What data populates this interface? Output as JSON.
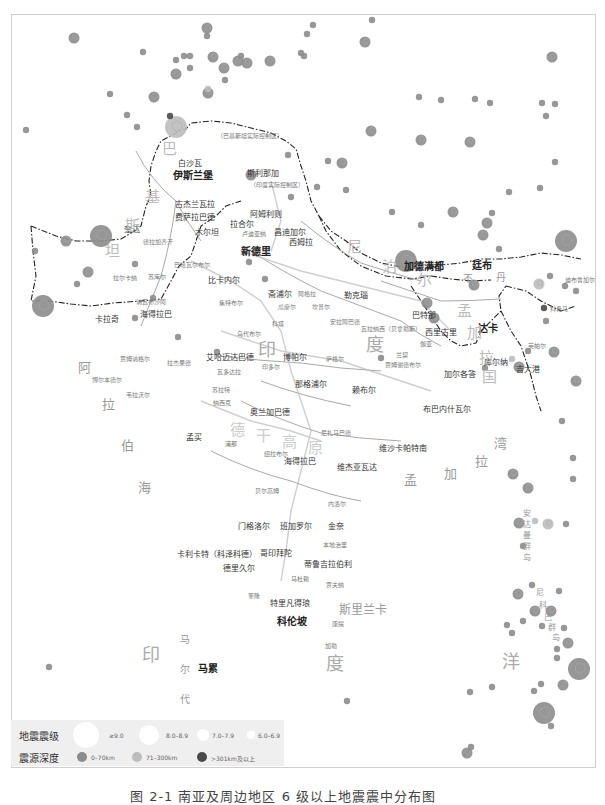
{
  "colors": {
    "shallow": "#8c8c8c",
    "intermediate": "#bdbdbd",
    "deep": "#4a4a4a",
    "border": "#222222",
    "river": "#9a9a9a",
    "legend_bg": "#efefef"
  },
  "legend": {
    "magnitude_title": "地震震级",
    "magnitude_items": [
      {
        "label": "≥9.0",
        "size": 30
      },
      {
        "label": "8.0–8.9",
        "size": 22
      },
      {
        "label": "7.0–7.9",
        "size": 14
      },
      {
        "label": "6.0–6.9",
        "size": 8
      }
    ],
    "depth_title": "震源深度",
    "depth_items": [
      {
        "label": "0–70km",
        "color": "#8c8c8c"
      },
      {
        "label": "71–300km",
        "color": "#bdbdbd"
      },
      {
        "label": ">301km及以上",
        "color": "#4a4a4a"
      }
    ]
  },
  "caption": "图 2-1  南亚及周边地区 6 级以上地震震中分布图",
  "labels": {
    "capitals": {
      "islamabad": "伊斯兰堡",
      "new_delhi": "新德里",
      "kathmandu": "加德满都",
      "thimphu": "廷布",
      "dhaka": "达卡",
      "colombo": "科伦坡",
      "male": "马累"
    },
    "cities": {
      "peshawar": "白沙瓦",
      "srinagar": "斯利那加",
      "srinagar_note": "（印度实际控制区）",
      "pak_kashmir_note": "（巴基斯坦实际控制区）",
      "gilgit": "吉尔吉特",
      "kargil": "卡尔吉尔",
      "leh": "列城",
      "gujranwala": "古杰兰瓦拉",
      "faisalabad": "费萨拉巴德",
      "amritsar": "阿姆利则",
      "lahore": "拉合尔",
      "multan": "木尔坦",
      "ludhiana": "卢迪亚纳",
      "chandigarh": "昌迪加尔",
      "shimla": "西姆拉",
      "quetta": "奎达",
      "dera_ghazi_khan": "德拉加齐汗",
      "bahawalpur": "巴哈瓦尔布尔",
      "sukkur": "苏库尔",
      "larkana": "拉尔卡纳",
      "nawabshah": "讷瓦布沙阿",
      "hyderabad_pk": "海得拉巴",
      "karachi": "卡拉奇",
      "bikaner": "比卡内尔",
      "jaipur": "斋浦尔",
      "jodhpur": "焦特布尔",
      "agra": "阿格拉",
      "gwalior": "瓜廖尔",
      "kanpur": "坎普尔",
      "lucknow": "勒克瑙",
      "allahabad": "安拉阿巴德",
      "varanasi": "瓦拉纳西（贝拿勒斯）",
      "kota": "科塔",
      "udaipur": "乌代布尔",
      "patna": "巴特那",
      "siliguri": "西里古里",
      "gaya": "伽亚",
      "jamshedpur": "贾姆谢德布尔",
      "ranchi": "兰契",
      "dhanbad": "丹巴德",
      "kolkata": "加尔各答",
      "khulna": "库尔纳",
      "chittagong": "吉大港",
      "imphal": "英帕尔",
      "kohima": "科希马",
      "dibrugarh": "迪布鲁加尔",
      "ahmedabad": "艾哈迈达巴德",
      "rajkot": "拉杰果德",
      "jamnagar": "贾姆讷格尔",
      "porbandar": "博尔本德尔",
      "veraval": "韦拉沃尔",
      "vadodara": "瓦多达拉",
      "surat": "苏拉特",
      "bhopal": "博帕尔",
      "indore": "印多尔",
      "sagar": "萨格尔",
      "jabalpur": "贾巴尔普尔",
      "nagpur": "那格浦尔",
      "raipur": "赖布尔",
      "bhubaneswar": "布巴内什瓦尔",
      "nashik": "纳西克",
      "mumbai": "孟买",
      "aurangabad": "奥兰加巴德",
      "pune": "浦那",
      "solapur": "绍拉布尔",
      "nizamabad": "尼扎马巴德",
      "hyderabad_in": "海得拉巴",
      "vijayawada": "维杰亚瓦达",
      "visakhapatnam": "维沙卡帕特南",
      "belgaum": "贝尔高姆",
      "nellore": "内洛尔",
      "mangalore": "门格洛尔",
      "bangalore": "班加罗尔",
      "chennai": "金奈",
      "calicut": "卡利卡特（科泽科德）",
      "coimbatore": "哥印拜陀",
      "pondicherry": "本地治里",
      "trichur": "德里久尔",
      "tiruchirappalli": "蒂鲁吉拉伯利",
      "madurai": "马杜赖",
      "kochi": "奎隆",
      "jaffna": "贾夫纳",
      "thiruvananthapuram": "特里凡得琅",
      "kandy": "康提",
      "galle": "加勒"
    },
    "regions": {
      "india_1": "印",
      "india_2": "度",
      "pakistan_1": "巴",
      "pakistan_2": "基",
      "pakistan_3": "斯",
      "pakistan_4": "坦",
      "nepal_1": "尼",
      "nepal_2": "泊",
      "nepal_3": "尔",
      "bhutan_1": "不",
      "bhutan_2": "丹",
      "bangladesh_1": "孟",
      "bangladesh_2": "加",
      "bangladesh_3": "拉",
      "bangladesh_4": "国",
      "sri_lanka": "斯里兰卡",
      "arabian_sea": [
        "阿",
        "拉",
        "伯",
        "海"
      ],
      "bay_of_bengal": [
        "孟",
        "加",
        "拉",
        "湾"
      ],
      "indian_ocean": [
        "印",
        "度",
        "洋"
      ],
      "maldives": [
        "马",
        "尔",
        "代",
        "夫"
      ],
      "andaman": [
        "安",
        "达",
        "曼",
        "群",
        "岛"
      ],
      "nicobar": [
        "尼",
        "科",
        "巴",
        "群",
        "岛"
      ],
      "deccan": [
        "德",
        "干",
        "高",
        "原"
      ]
    }
  },
  "chart_data": {
    "type": "scatter",
    "title": "南亚及周边地区 6 级以上地震震中分布图",
    "legend": {
      "size_encoding": [
        "≥9.0",
        "8.0–8.9",
        "7.0–7.9",
        "6.0–6.9"
      ],
      "color_encoding": [
        "0–70km",
        "71–300km",
        ">301km及以上"
      ]
    },
    "points": [
      {
        "x": 73,
        "y": 37,
        "m": 7,
        "d": 0
      },
      {
        "x": 142,
        "y": 51,
        "m": 6,
        "d": 0
      },
      {
        "x": 175,
        "y": 59,
        "m": 6,
        "d": 0
      },
      {
        "x": 183,
        "y": 55,
        "m": 6,
        "d": 0
      },
      {
        "x": 189,
        "y": 55,
        "m": 6,
        "d": 0
      },
      {
        "x": 206,
        "y": 27,
        "m": 7,
        "d": 0
      },
      {
        "x": 206,
        "y": 35,
        "m": 6,
        "d": 0
      },
      {
        "x": 212,
        "y": 56,
        "m": 7,
        "d": 0
      },
      {
        "x": 237,
        "y": 60,
        "m": 7,
        "d": 0
      },
      {
        "x": 240,
        "y": 55,
        "m": 6,
        "d": 0
      },
      {
        "x": 246,
        "y": 62,
        "m": 7,
        "d": 0
      },
      {
        "x": 269,
        "y": 60,
        "m": 7,
        "d": 0
      },
      {
        "x": 223,
        "y": 67,
        "m": 7,
        "d": 0
      },
      {
        "x": 175,
        "y": 73,
        "m": 7,
        "d": 0
      },
      {
        "x": 189,
        "y": 67,
        "m": 6,
        "d": 0
      },
      {
        "x": 224,
        "y": 79,
        "m": 6,
        "d": 0
      },
      {
        "x": 207,
        "y": 92,
        "m": 7,
        "d": 0
      },
      {
        "x": 207,
        "y": 88,
        "m": 6,
        "d": 1
      },
      {
        "x": 153,
        "y": 96,
        "m": 7,
        "d": 0
      },
      {
        "x": 109,
        "y": 93,
        "m": 6,
        "d": 0
      },
      {
        "x": 126,
        "y": 114,
        "m": 6,
        "d": 0
      },
      {
        "x": 136,
        "y": 126,
        "m": 6,
        "d": 0
      },
      {
        "x": 175,
        "y": 126,
        "m": 8,
        "d": 1
      },
      {
        "x": 169,
        "y": 115,
        "m": 6,
        "d": 2
      },
      {
        "x": 25,
        "y": 129,
        "m": 6,
        "d": 0
      },
      {
        "x": 300,
        "y": 52,
        "m": 6,
        "d": 0
      },
      {
        "x": 312,
        "y": 24,
        "m": 6,
        "d": 0
      },
      {
        "x": 306,
        "y": 33,
        "m": 6,
        "d": 0
      },
      {
        "x": 303,
        "y": 55,
        "m": 6,
        "d": 0
      },
      {
        "x": 371,
        "y": 19,
        "m": 6,
        "d": 0
      },
      {
        "x": 364,
        "y": 41,
        "m": 7,
        "d": 0
      },
      {
        "x": 370,
        "y": 130,
        "m": 7,
        "d": 0
      },
      {
        "x": 551,
        "y": 56,
        "m": 7,
        "d": 0
      },
      {
        "x": 418,
        "y": 96,
        "m": 6,
        "d": 0
      },
      {
        "x": 440,
        "y": 99,
        "m": 6,
        "d": 0
      },
      {
        "x": 474,
        "y": 98,
        "m": 6,
        "d": 0
      },
      {
        "x": 489,
        "y": 102,
        "m": 6,
        "d": 0
      },
      {
        "x": 541,
        "y": 102,
        "m": 6,
        "d": 0
      },
      {
        "x": 554,
        "y": 103,
        "m": 6,
        "d": 0
      },
      {
        "x": 545,
        "y": 115,
        "m": 6,
        "d": 0
      },
      {
        "x": 469,
        "y": 141,
        "m": 7,
        "d": 0
      },
      {
        "x": 420,
        "y": 139,
        "m": 7,
        "d": 0
      },
      {
        "x": 250,
        "y": 174,
        "m": 7,
        "d": 0
      },
      {
        "x": 287,
        "y": 154,
        "m": 6,
        "d": 0
      },
      {
        "x": 327,
        "y": 160,
        "m": 6,
        "d": 0
      },
      {
        "x": 341,
        "y": 162,
        "m": 7,
        "d": 0
      },
      {
        "x": 316,
        "y": 186,
        "m": 6,
        "d": 0
      },
      {
        "x": 290,
        "y": 196,
        "m": 6,
        "d": 0
      },
      {
        "x": 248,
        "y": 261,
        "m": 6,
        "d": 0
      },
      {
        "x": 345,
        "y": 189,
        "m": 6,
        "d": 0
      },
      {
        "x": 391,
        "y": 211,
        "m": 6,
        "d": 0
      },
      {
        "x": 420,
        "y": 224,
        "m": 6,
        "d": 0
      },
      {
        "x": 452,
        "y": 211,
        "m": 7,
        "d": 0
      },
      {
        "x": 491,
        "y": 212,
        "m": 6,
        "d": 0
      },
      {
        "x": 539,
        "y": 187,
        "m": 6,
        "d": 0
      },
      {
        "x": 508,
        "y": 191,
        "m": 6,
        "d": 0
      },
      {
        "x": 482,
        "y": 234,
        "m": 7,
        "d": 0
      },
      {
        "x": 486,
        "y": 222,
        "m": 7,
        "d": 0
      },
      {
        "x": 554,
        "y": 161,
        "m": 6,
        "d": 0
      },
      {
        "x": 565,
        "y": 240,
        "m": 8,
        "d": 0
      },
      {
        "x": 498,
        "y": 248,
        "m": 6,
        "d": 0
      },
      {
        "x": 100,
        "y": 235,
        "m": 8,
        "d": 0
      },
      {
        "x": 65,
        "y": 240,
        "m": 7,
        "d": 0
      },
      {
        "x": 42,
        "y": 305,
        "m": 8,
        "d": 0
      },
      {
        "x": 34,
        "y": 250,
        "m": 6,
        "d": 0
      },
      {
        "x": 134,
        "y": 263,
        "m": 6,
        "d": 0
      },
      {
        "x": 87,
        "y": 271,
        "m": 7,
        "d": 0
      },
      {
        "x": 76,
        "y": 283,
        "m": 6,
        "d": 0
      },
      {
        "x": 134,
        "y": 317,
        "m": 6,
        "d": 0
      },
      {
        "x": 216,
        "y": 351,
        "m": 6,
        "d": 0
      },
      {
        "x": 152,
        "y": 297,
        "m": 6,
        "d": 0
      },
      {
        "x": 177,
        "y": 336,
        "m": 6,
        "d": 0
      },
      {
        "x": 264,
        "y": 278,
        "m": 6,
        "d": 0
      },
      {
        "x": 405,
        "y": 260,
        "m": 8,
        "d": 0
      },
      {
        "x": 380,
        "y": 357,
        "m": 6,
        "d": 0
      },
      {
        "x": 473,
        "y": 284,
        "m": 7,
        "d": 0
      },
      {
        "x": 433,
        "y": 317,
        "m": 7,
        "d": 0
      },
      {
        "x": 426,
        "y": 302,
        "m": 7,
        "d": 0
      },
      {
        "x": 545,
        "y": 320,
        "m": 6,
        "d": 0
      },
      {
        "x": 549,
        "y": 275,
        "m": 6,
        "d": 0
      },
      {
        "x": 543,
        "y": 307,
        "m": 6,
        "d": 2
      },
      {
        "x": 575,
        "y": 290,
        "m": 6,
        "d": 0
      },
      {
        "x": 564,
        "y": 285,
        "m": 6,
        "d": 0
      },
      {
        "x": 538,
        "y": 283,
        "m": 7,
        "d": 1
      },
      {
        "x": 553,
        "y": 351,
        "m": 7,
        "d": 0
      },
      {
        "x": 518,
        "y": 366,
        "m": 7,
        "d": 0
      },
      {
        "x": 484,
        "y": 367,
        "m": 6,
        "d": 0
      },
      {
        "x": 527,
        "y": 350,
        "m": 6,
        "d": 0
      },
      {
        "x": 511,
        "y": 358,
        "m": 6,
        "d": 1
      },
      {
        "x": 575,
        "y": 380,
        "m": 7,
        "d": 0
      },
      {
        "x": 561,
        "y": 420,
        "m": 6,
        "d": 0
      },
      {
        "x": 512,
        "y": 473,
        "m": 7,
        "d": 0
      },
      {
        "x": 527,
        "y": 487,
        "m": 7,
        "d": 0
      },
      {
        "x": 534,
        "y": 520,
        "m": 6,
        "d": 1
      },
      {
        "x": 547,
        "y": 523,
        "m": 7,
        "d": 1
      },
      {
        "x": 518,
        "y": 522,
        "m": 7,
        "d": 0
      },
      {
        "x": 522,
        "y": 545,
        "m": 6,
        "d": 0
      },
      {
        "x": 572,
        "y": 457,
        "m": 6,
        "d": 0
      },
      {
        "x": 572,
        "y": 478,
        "m": 6,
        "d": 0
      },
      {
        "x": 565,
        "y": 523,
        "m": 6,
        "d": 0
      },
      {
        "x": 517,
        "y": 593,
        "m": 7,
        "d": 0
      },
      {
        "x": 534,
        "y": 610,
        "m": 7,
        "d": 0
      },
      {
        "x": 550,
        "y": 610,
        "m": 7,
        "d": 0
      },
      {
        "x": 522,
        "y": 620,
        "m": 6,
        "d": 0
      },
      {
        "x": 541,
        "y": 625,
        "m": 6,
        "d": 0
      },
      {
        "x": 511,
        "y": 632,
        "m": 6,
        "d": 0
      },
      {
        "x": 563,
        "y": 627,
        "m": 6,
        "d": 0
      },
      {
        "x": 567,
        "y": 642,
        "m": 7,
        "d": 0
      },
      {
        "x": 556,
        "y": 657,
        "m": 6,
        "d": 0
      },
      {
        "x": 578,
        "y": 668,
        "m": 8,
        "d": 0
      },
      {
        "x": 540,
        "y": 683,
        "m": 6,
        "d": 0
      },
      {
        "x": 543,
        "y": 712,
        "m": 8,
        "d": 0
      },
      {
        "x": 562,
        "y": 684,
        "m": 7,
        "d": 0
      },
      {
        "x": 556,
        "y": 648,
        "m": 6,
        "d": 0
      },
      {
        "x": 533,
        "y": 690,
        "m": 6,
        "d": 0
      },
      {
        "x": 491,
        "y": 686,
        "m": 6,
        "d": 0
      },
      {
        "x": 469,
        "y": 691,
        "m": 6,
        "d": 0
      },
      {
        "x": 558,
        "y": 590,
        "m": 6,
        "d": 0
      },
      {
        "x": 531,
        "y": 584,
        "m": 6,
        "d": 0
      },
      {
        "x": 506,
        "y": 624,
        "m": 6,
        "d": 0
      },
      {
        "x": 346,
        "y": 700,
        "m": 6,
        "d": 0
      },
      {
        "x": 48,
        "y": 666,
        "m": 6,
        "d": 0
      },
      {
        "x": 466,
        "y": 752,
        "m": 7,
        "d": 0
      },
      {
        "x": 550,
        "y": 725,
        "m": 6,
        "d": 0
      },
      {
        "x": 470,
        "y": 746,
        "m": 6,
        "d": 0
      }
    ]
  }
}
